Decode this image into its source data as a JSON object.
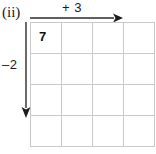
{
  "figure": {
    "part_label": "(ii)",
    "width": 156,
    "height": 154,
    "background_color": "#ffffff"
  },
  "grid": {
    "columns": 4,
    "rows": 4,
    "cell_width": 31,
    "cell_height": 31,
    "line_color": "#c9c9c9",
    "cells": [
      [
        "7",
        "",
        "",
        ""
      ],
      [
        "",
        "",
        "",
        ""
      ],
      [
        "",
        "",
        "",
        ""
      ],
      [
        "",
        "",
        "",
        ""
      ]
    ],
    "filled_cell_value": "7"
  },
  "arrows": {
    "horizontal": {
      "label": "+ 3",
      "direction": "right",
      "color": "#2b2b2b"
    },
    "vertical": {
      "label": "–2",
      "direction": "down",
      "color": "#2b2b2b"
    }
  }
}
